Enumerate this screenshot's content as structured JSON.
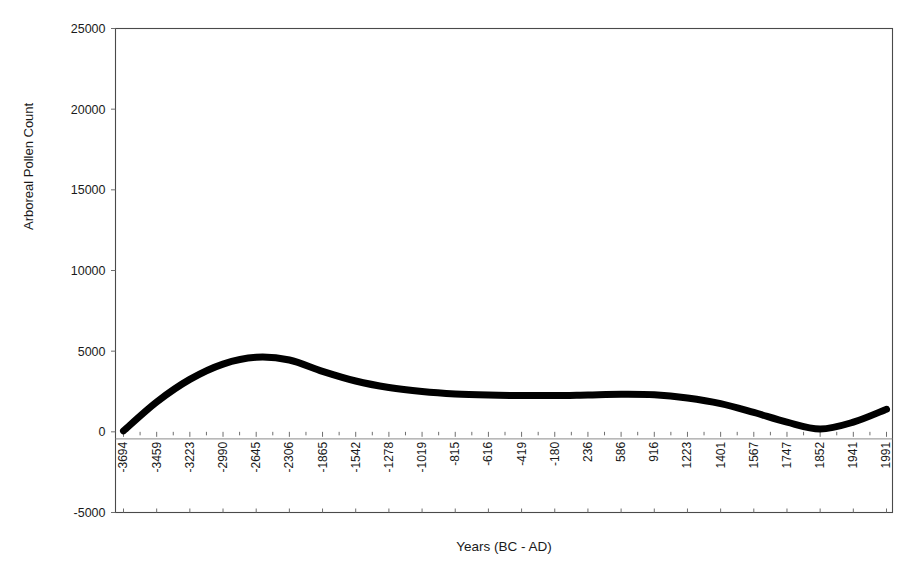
{
  "chart_data": {
    "type": "line",
    "title": "",
    "xlabel": "Years (BC - AD)",
    "ylabel": "Arboreal Pollen Count",
    "grid": false,
    "legend": false,
    "ylim": [
      -5000,
      25000
    ],
    "ytick_labels": [
      "25000",
      "20000",
      "15000",
      "10000",
      "5000",
      "0",
      "-5000"
    ],
    "ytick_values": [
      25000,
      20000,
      15000,
      10000,
      5000,
      0,
      -5000
    ],
    "categories": [
      "-3694",
      "-3459",
      "-3223",
      "-2990",
      "-2645",
      "-2306",
      "-1865",
      "-1542",
      "-1278",
      "-1019",
      "-815",
      "-616",
      "-419",
      "-180",
      "236",
      "586",
      "916",
      "1223",
      "1401",
      "1567",
      "1747",
      "1852",
      "1941",
      "1991"
    ],
    "series": [
      {
        "name": "Arboreal Pollen Count",
        "color": "#000000",
        "values": [
          60,
          1850,
          3250,
          4200,
          4620,
          4450,
          3750,
          3150,
          2750,
          2500,
          2350,
          2280,
          2250,
          2250,
          2290,
          2330,
          2300,
          2100,
          1750,
          1200,
          600,
          180,
          600,
          1400
        ]
      }
    ]
  },
  "axes": {
    "x_tick_count": 24,
    "minor_ticks": true
  }
}
